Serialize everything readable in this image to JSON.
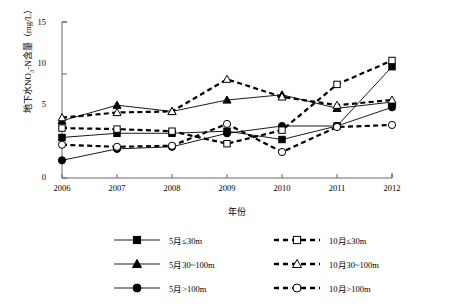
{
  "chart_data": {
    "type": "line",
    "title": "",
    "xlabel": "年份",
    "ylabel": "地下水NO3-N含量（mg/L）",
    "ylabel_parts": {
      "pre": "地下水NO",
      "sub": "3",
      "post": "-N含量（mg/L）"
    },
    "categories": [
      "2006",
      "2007",
      "2008",
      "2009",
      "2010",
      "2011",
      "2012"
    ],
    "x": [
      2006,
      2007,
      2008,
      2009,
      2010,
      2011,
      2012
    ],
    "ylim": [
      0,
      15
    ],
    "yticks": [
      0,
      5,
      10,
      15
    ],
    "xlim": [
      2006,
      2012
    ],
    "grid": false,
    "legend_position": "bottom",
    "series": [
      {
        "name": "5月≤30m",
        "marker": "filled-square",
        "line": "solid",
        "values": [
          3.9,
          4.3,
          4.3,
          4.5,
          3.7,
          5.0,
          10.7
        ]
      },
      {
        "name": "5月30~100m",
        "marker": "filled-triangle",
        "line": "solid",
        "values": [
          5.5,
          7.0,
          6.4,
          7.5,
          8.0,
          6.7,
          7.3
        ]
      },
      {
        "name": "5月>100m",
        "marker": "filled-circle",
        "line": "solid",
        "values": [
          1.7,
          2.8,
          3.0,
          4.3,
          5.0,
          5.0,
          6.8
        ]
      },
      {
        "name": "10月≤30m",
        "marker": "open-square",
        "line": "dashed",
        "values": [
          4.8,
          4.7,
          4.5,
          3.3,
          4.6,
          9.0,
          11.3
        ]
      },
      {
        "name": "10月30~100m",
        "marker": "open-triangle",
        "line": "dashed",
        "values": [
          5.8,
          6.3,
          6.4,
          9.5,
          7.8,
          7.0,
          7.5
        ]
      },
      {
        "name": "10月>100m",
        "marker": "open-circle",
        "line": "dashed",
        "values": [
          3.2,
          3.0,
          3.1,
          5.2,
          2.5,
          4.9,
          5.1
        ]
      }
    ]
  },
  "legend": {
    "items": [
      {
        "label": "5月≤30m",
        "marker": "filled-square",
        "line": "solid"
      },
      {
        "label": "5月30~100m",
        "marker": "filled-triangle",
        "line": "solid"
      },
      {
        "label": "5月>100m",
        "marker": "filled-circle",
        "line": "solid"
      },
      {
        "label": "10月≤30m",
        "marker": "open-square",
        "line": "dashed"
      },
      {
        "label": "10月30~100m",
        "marker": "open-triangle",
        "line": "dashed"
      },
      {
        "label": "10月>100m",
        "marker": "open-circle",
        "line": "dashed"
      }
    ]
  },
  "colors": {
    "line": "#000000",
    "marker_fill": "#000000",
    "marker_open": "#ffffff",
    "axis": "#555555",
    "background": "#ffffff"
  }
}
